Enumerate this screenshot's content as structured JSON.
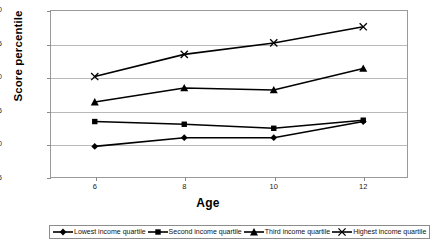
{
  "chart_data": {
    "type": "line",
    "title": "",
    "xlabel": "Age",
    "ylabel": "Score percentile",
    "x": [
      6,
      8,
      10,
      12
    ],
    "xtick_labels": [
      "6",
      "8",
      "10",
      "12"
    ],
    "ytick_labels": [
      "45",
      "50",
      "55",
      "60",
      "65",
      "70"
    ],
    "ylim": [
      45,
      70
    ],
    "xlim": [
      5,
      13
    ],
    "grid": true,
    "legend_position": "bottom",
    "series": [
      {
        "name": "Lowest income quartile",
        "marker": "diamond",
        "color": "#000000",
        "values": [
          49.7,
          51.0,
          51.0,
          53.4
        ]
      },
      {
        "name": "Second income quartile",
        "marker": "square",
        "color": "#000000",
        "values": [
          53.4,
          53.0,
          52.4,
          53.6
        ]
      },
      {
        "name": "Third income quartile",
        "marker": "triangle",
        "color": "#000000",
        "values": [
          56.3,
          58.4,
          58.1,
          61.3
        ]
      },
      {
        "name": "Highest income quartile",
        "marker": "x",
        "color": "#000000",
        "values": [
          60.1,
          63.4,
          65.1,
          67.5
        ]
      }
    ]
  }
}
